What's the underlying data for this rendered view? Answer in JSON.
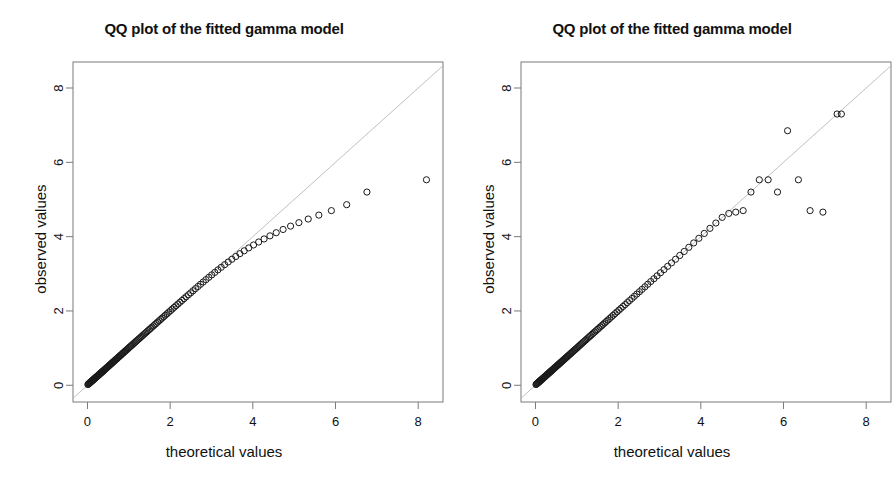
{
  "figure": {
    "width": 896,
    "height": 478,
    "background": "#ffffff",
    "foreground": "#111111",
    "refline_color": "#b0b0b0",
    "point_color": "#1a1a1a",
    "panel_count": 2
  },
  "chart_data": [
    {
      "type": "scatter",
      "panel": "left",
      "title": "QQ plot of the fitted gamma model",
      "xlabel": "theoretical values",
      "ylabel": "observed values",
      "xlim": [
        -0.35,
        8.6
      ],
      "ylim": [
        -0.45,
        8.7
      ],
      "xticks": [
        0,
        2,
        4,
        6,
        8
      ],
      "yticks": [
        0,
        2,
        4,
        6,
        8
      ],
      "xticklabels": [
        "0",
        "2",
        "4",
        "6",
        "8"
      ],
      "yticklabels": [
        "0",
        "2",
        "4",
        "6",
        "8"
      ],
      "grid": false,
      "legend": null,
      "annotations": [],
      "reference_line": {
        "type": "identity",
        "slope": 1,
        "intercept": 0,
        "color": "#b0b0b0",
        "width": 0.8
      },
      "marker": {
        "shape": "open-circle",
        "size": 3.1,
        "edge": "#1a1a1a",
        "fill": "none"
      },
      "x": [
        0.01,
        0.021,
        0.031,
        0.04,
        0.05,
        0.059,
        0.068,
        0.077,
        0.086,
        0.095,
        0.104,
        0.113,
        0.122,
        0.131,
        0.14,
        0.149,
        0.158,
        0.167,
        0.176,
        0.185,
        0.195,
        0.204,
        0.214,
        0.223,
        0.233,
        0.243,
        0.253,
        0.263,
        0.273,
        0.283,
        0.294,
        0.304,
        0.315,
        0.326,
        0.337,
        0.348,
        0.359,
        0.371,
        0.382,
        0.394,
        0.406,
        0.418,
        0.43,
        0.443,
        0.455,
        0.468,
        0.481,
        0.494,
        0.508,
        0.521,
        0.535,
        0.549,
        0.563,
        0.578,
        0.592,
        0.607,
        0.622,
        0.638,
        0.653,
        0.669,
        0.685,
        0.702,
        0.718,
        0.735,
        0.752,
        0.77,
        0.788,
        0.806,
        0.824,
        0.843,
        0.862,
        0.881,
        0.901,
        0.921,
        0.941,
        0.962,
        0.983,
        1.005,
        1.026,
        1.049,
        1.071,
        1.094,
        1.118,
        1.142,
        1.166,
        1.191,
        1.216,
        1.242,
        1.268,
        1.295,
        1.322,
        1.35,
        1.378,
        1.407,
        1.437,
        1.467,
        1.498,
        1.529,
        1.561,
        1.594,
        1.628,
        1.662,
        1.697,
        1.733,
        1.77,
        1.807,
        1.846,
        1.885,
        1.925,
        1.966,
        2.009,
        2.052,
        2.096,
        2.142,
        2.189,
        2.237,
        2.286,
        2.337,
        2.389,
        2.443,
        2.498,
        2.555,
        2.613,
        2.674,
        2.736,
        2.8,
        2.866,
        2.935,
        3.006,
        3.079,
        3.156,
        3.235,
        3.318,
        3.404,
        3.494,
        3.588,
        3.687,
        3.791,
        3.901,
        4.017,
        4.141,
        4.272,
        4.414,
        4.566,
        4.732,
        4.913,
        5.114,
        5.34,
        5.597,
        5.9,
        6.27,
        6.76,
        8.2
      ],
      "y": [
        0.02,
        0.031,
        0.041,
        0.05,
        0.06,
        0.069,
        0.078,
        0.087,
        0.096,
        0.104,
        0.113,
        0.122,
        0.131,
        0.14,
        0.148,
        0.157,
        0.166,
        0.175,
        0.184,
        0.193,
        0.203,
        0.212,
        0.221,
        0.231,
        0.24,
        0.25,
        0.26,
        0.27,
        0.28,
        0.29,
        0.3,
        0.31,
        0.321,
        0.332,
        0.343,
        0.354,
        0.365,
        0.377,
        0.388,
        0.4,
        0.412,
        0.424,
        0.436,
        0.449,
        0.461,
        0.474,
        0.487,
        0.5,
        0.513,
        0.527,
        0.541,
        0.555,
        0.569,
        0.583,
        0.598,
        0.613,
        0.628,
        0.643,
        0.659,
        0.675,
        0.691,
        0.707,
        0.724,
        0.741,
        0.758,
        0.776,
        0.794,
        0.812,
        0.83,
        0.849,
        0.868,
        0.888,
        0.907,
        0.927,
        0.948,
        0.968,
        0.989,
        1.011,
        1.033,
        1.055,
        1.077,
        1.1,
        1.124,
        1.148,
        1.172,
        1.197,
        1.222,
        1.247,
        1.273,
        1.3,
        1.327,
        1.355,
        1.383,
        1.412,
        1.441,
        1.471,
        1.502,
        1.533,
        1.565,
        1.598,
        1.631,
        1.665,
        1.7,
        1.736,
        1.772,
        1.809,
        1.847,
        1.886,
        1.926,
        1.967,
        2.009,
        2.052,
        2.096,
        2.141,
        2.187,
        2.234,
        2.282,
        2.332,
        2.383,
        2.436,
        2.489,
        2.544,
        2.601,
        2.659,
        2.719,
        2.78,
        2.842,
        2.906,
        2.971,
        3.038,
        3.106,
        3.175,
        3.246,
        3.318,
        3.392,
        3.466,
        3.542,
        3.619,
        3.697,
        3.776,
        3.856,
        3.938,
        4.021,
        4.106,
        4.193,
        4.283,
        4.376,
        4.474,
        4.58,
        4.7,
        4.86,
        5.2,
        5.53
      ]
    },
    {
      "type": "scatter",
      "panel": "right",
      "title": "QQ plot of the fitted gamma model",
      "xlabel": "theoretical values",
      "ylabel": "observed values",
      "xlim": [
        -0.35,
        8.6
      ],
      "ylim": [
        -0.45,
        8.7
      ],
      "xticks": [
        0,
        2,
        4,
        6,
        8
      ],
      "yticks": [
        0,
        2,
        4,
        6,
        8
      ],
      "xticklabels": [
        "0",
        "2",
        "4",
        "6",
        "8"
      ],
      "yticklabels": [
        "0",
        "2",
        "4",
        "6",
        "8"
      ],
      "grid": false,
      "legend": null,
      "annotations": [],
      "reference_line": {
        "type": "identity",
        "slope": 1,
        "intercept": 0,
        "color": "#b0b0b0",
        "width": 0.8
      },
      "marker": {
        "shape": "open-circle",
        "size": 3.1,
        "edge": "#1a1a1a",
        "fill": "none"
      },
      "x": [
        0.012,
        0.024,
        0.036,
        0.047,
        0.058,
        0.069,
        0.079,
        0.09,
        0.1,
        0.111,
        0.121,
        0.131,
        0.142,
        0.152,
        0.163,
        0.173,
        0.184,
        0.194,
        0.205,
        0.216,
        0.227,
        0.238,
        0.249,
        0.26,
        0.271,
        0.283,
        0.294,
        0.306,
        0.318,
        0.33,
        0.342,
        0.354,
        0.366,
        0.379,
        0.392,
        0.405,
        0.418,
        0.431,
        0.444,
        0.458,
        0.472,
        0.486,
        0.5,
        0.514,
        0.529,
        0.544,
        0.559,
        0.575,
        0.59,
        0.606,
        0.622,
        0.639,
        0.656,
        0.673,
        0.69,
        0.708,
        0.726,
        0.744,
        0.763,
        0.782,
        0.801,
        0.821,
        0.841,
        0.861,
        0.882,
        0.903,
        0.925,
        0.947,
        0.969,
        0.992,
        1.015,
        1.039,
        1.063,
        1.088,
        1.113,
        1.139,
        1.165,
        1.192,
        1.219,
        1.247,
        1.276,
        1.305,
        1.335,
        1.366,
        1.397,
        1.429,
        1.462,
        1.496,
        1.53,
        1.565,
        1.601,
        1.638,
        1.676,
        1.715,
        1.755,
        1.796,
        1.838,
        1.881,
        1.926,
        1.972,
        2.019,
        2.067,
        2.117,
        2.169,
        2.222,
        2.277,
        2.333,
        2.392,
        2.452,
        2.515,
        2.579,
        2.647,
        2.716,
        2.789,
        2.864,
        2.942,
        3.024,
        3.109,
        3.198,
        3.291,
        3.389,
        3.491,
        3.598,
        3.71,
        3.828,
        3.952,
        4.083,
        4.22,
        4.364,
        4.516,
        4.676,
        4.845,
        5.024,
        5.213,
        5.414,
        5.628,
        5.855,
        6.098,
        6.36,
        6.643,
        6.953,
        7.296,
        7.4
      ],
      "y": [
        0.02,
        0.032,
        0.043,
        0.054,
        0.064,
        0.075,
        0.085,
        0.096,
        0.106,
        0.116,
        0.127,
        0.137,
        0.147,
        0.158,
        0.168,
        0.179,
        0.189,
        0.2,
        0.211,
        0.221,
        0.232,
        0.243,
        0.254,
        0.265,
        0.277,
        0.288,
        0.3,
        0.311,
        0.323,
        0.335,
        0.347,
        0.359,
        0.371,
        0.384,
        0.396,
        0.409,
        0.422,
        0.435,
        0.449,
        0.462,
        0.476,
        0.49,
        0.504,
        0.519,
        0.533,
        0.548,
        0.563,
        0.578,
        0.594,
        0.61,
        0.626,
        0.642,
        0.659,
        0.676,
        0.693,
        0.711,
        0.729,
        0.747,
        0.766,
        0.785,
        0.804,
        0.824,
        0.844,
        0.864,
        0.885,
        0.906,
        0.928,
        0.95,
        0.972,
        0.995,
        1.018,
        1.042,
        1.066,
        1.091,
        1.116,
        1.142,
        1.168,
        1.195,
        1.222,
        1.25,
        1.279,
        1.308,
        1.338,
        1.369,
        1.4,
        1.432,
        1.465,
        1.499,
        1.533,
        1.568,
        1.604,
        1.641,
        1.679,
        1.718,
        1.758,
        1.799,
        1.841,
        1.884,
        1.929,
        1.975,
        2.022,
        2.07,
        2.12,
        2.172,
        2.225,
        2.28,
        2.336,
        2.395,
        2.455,
        2.518,
        2.582,
        2.65,
        2.719,
        2.792,
        2.867,
        2.945,
        3.027,
        3.112,
        3.201,
        3.294,
        3.392,
        3.494,
        3.601,
        3.713,
        3.831,
        3.955,
        4.086,
        4.223,
        4.367,
        4.519,
        4.625,
        4.66,
        4.7,
        5.2,
        5.53,
        5.53,
        5.2,
        6.85,
        5.53,
        4.7,
        4.66,
        7.3,
        7.3
      ]
    }
  ]
}
